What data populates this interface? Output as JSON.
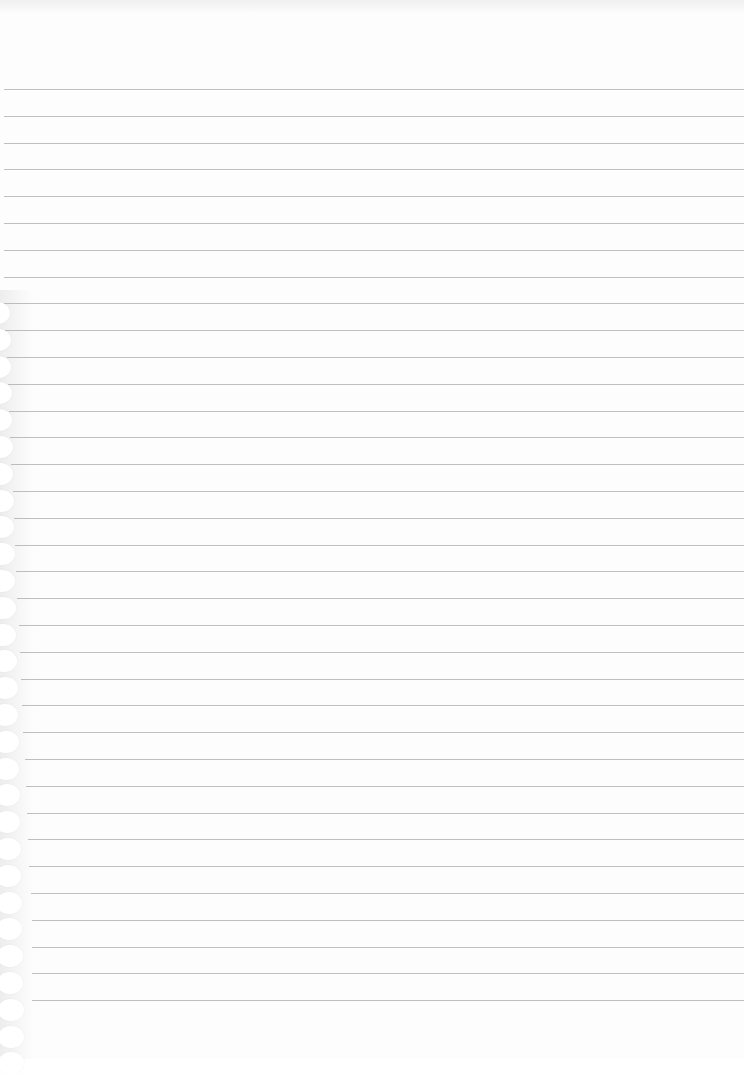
{
  "page": {
    "type": "lined-notebook-page",
    "width": 744,
    "height": 1059,
    "background_color": "#fdfdfd",
    "rule_color": "#a9a9a9",
    "rule_count": 35,
    "first_rule_y": 89,
    "rule_spacing": 26.8,
    "binding_holes_start_y": 300,
    "binding_edge_color": "#ededed",
    "text": ""
  }
}
